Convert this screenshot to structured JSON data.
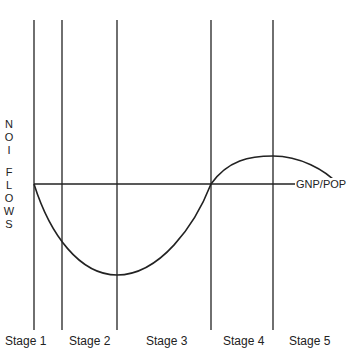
{
  "diagram": {
    "y_axis_label_top": [
      "N",
      "O",
      "I"
    ],
    "y_axis_label_bottom": [
      "F",
      "L",
      "O",
      "W",
      "S"
    ],
    "x_axis_label": "GNP/POP",
    "stages": [
      {
        "label": "Stage 1"
      },
      {
        "label": "Stage 2"
      },
      {
        "label": "Stage 3"
      },
      {
        "label": "Stage 4"
      },
      {
        "label": "Stage 5"
      }
    ],
    "line_color": "#222222"
  }
}
